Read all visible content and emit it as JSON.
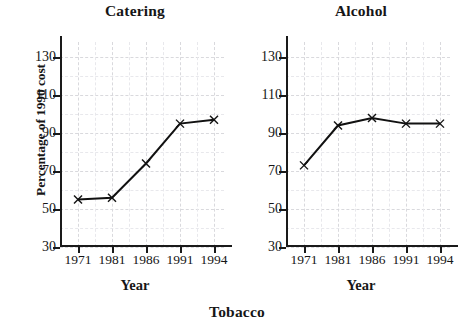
{
  "figure": {
    "ylabel": "Percentage of 1990 cost",
    "bottom_caption": "Tobacco"
  },
  "chart_data": [
    {
      "type": "line",
      "title": "Catering",
      "xlabel": "Year",
      "ylabel": "Percentage of 1990 cost",
      "categories": [
        "1971",
        "1981",
        "1986",
        "1991",
        "1994"
      ],
      "values": [
        55,
        56,
        74,
        95,
        97
      ],
      "yticks": [
        30,
        50,
        70,
        90,
        110,
        130
      ],
      "ylim": [
        30,
        138
      ],
      "grid": true,
      "marker": "x",
      "legend": "none"
    },
    {
      "type": "line",
      "title": "Alcohol",
      "xlabel": "Year",
      "ylabel": "Percentage of 1990 cost",
      "categories": [
        "1971",
        "1981",
        "1986",
        "1991",
        "1994"
      ],
      "values": [
        73,
        94,
        98,
        95,
        95
      ],
      "yticks": [
        30,
        50,
        70,
        90,
        110,
        130
      ],
      "ylim": [
        30,
        138
      ],
      "grid": true,
      "marker": "x",
      "legend": "none"
    }
  ]
}
